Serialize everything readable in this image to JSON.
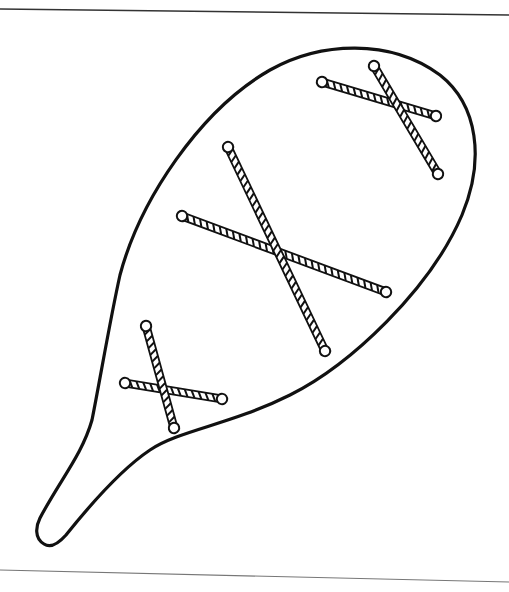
{
  "figure": {
    "colors": {
      "background": "#ffffff",
      "ink": "#111111",
      "border_line": "#555555"
    },
    "border": {
      "top": {
        "x1": 0,
        "y1": 9,
        "x2": 509,
        "y2": 15
      },
      "bottom": {
        "x1": 0,
        "y1": 570,
        "x2": 509,
        "y2": 582
      }
    },
    "paddle_outline_path": "M 44 544 C 34 538, 36 526, 40 518 C 60 480, 82 455, 92 420 C 100 380, 110 320, 120 275 C 140 200, 200 110, 270 70 C 320 42, 390 38, 440 75 C 478 105, 485 160, 462 215 C 430 290, 350 365, 290 395 C 230 425, 180 430, 150 450 C 120 470, 90 505, 66 535 C 58 544, 50 548, 44 544 Z",
    "stitches": [
      {
        "name": "stitch-top-right",
        "ropes": [
          {
            "x1": 322,
            "y1": 82,
            "x2": 436,
            "y2": 116
          },
          {
            "x1": 374,
            "y1": 66,
            "x2": 438,
            "y2": 174
          }
        ]
      },
      {
        "name": "stitch-middle",
        "ropes": [
          {
            "x1": 182,
            "y1": 216,
            "x2": 386,
            "y2": 292
          },
          {
            "x1": 228,
            "y1": 147,
            "x2": 325,
            "y2": 351
          }
        ]
      },
      {
        "name": "stitch-bottom-left",
        "ropes": [
          {
            "x1": 125,
            "y1": 383,
            "x2": 222,
            "y2": 399
          },
          {
            "x1": 146,
            "y1": 326,
            "x2": 174,
            "y2": 428
          }
        ]
      }
    ]
  }
}
